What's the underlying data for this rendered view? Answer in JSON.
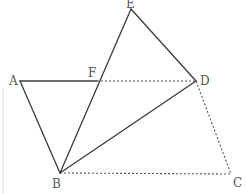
{
  "figure": {
    "title": "",
    "points": {
      "A": {
        "label": "A",
        "x": 20,
        "y": 81,
        "lx": 9,
        "ly": 85
      },
      "B": {
        "label": "B",
        "x": 60,
        "y": 173,
        "lx": 52,
        "ly": 188
      },
      "C": {
        "label": "C",
        "x": 231,
        "y": 174,
        "lx": 233,
        "ly": 187
      },
      "D": {
        "label": "D",
        "x": 196,
        "y": 81,
        "lx": 200,
        "ly": 85
      },
      "E": {
        "label": "E",
        "x": 131,
        "y": 9,
        "lx": 126,
        "ly": 8
      },
      "F": {
        "label": "F",
        "x": 97,
        "y": 81,
        "lx": 88,
        "ly": 77
      }
    },
    "solid_segments": [
      [
        "A",
        "F"
      ],
      [
        "A",
        "B"
      ],
      [
        "B",
        "E"
      ],
      [
        "E",
        "D"
      ],
      [
        "B",
        "D"
      ]
    ],
    "dashed_segments": [
      [
        "F",
        "D"
      ],
      [
        "B",
        "C"
      ],
      [
        "D",
        "C"
      ]
    ],
    "colors": {
      "line": "#3a3a3a",
      "dashed": "#555555",
      "label": "#555555",
      "background": "#ffffff"
    }
  }
}
